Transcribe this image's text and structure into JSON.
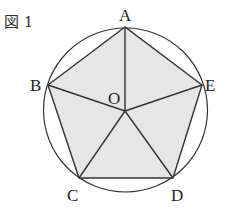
{
  "figure": {
    "caption": "図 1",
    "fill_color": "#e6e6e6",
    "stroke_color": "#333333",
    "circle": {
      "cx": 125.5,
      "cy": 110,
      "r": 82
    },
    "center": {
      "name": "O",
      "x": 125,
      "y": 111
    },
    "vertices": [
      {
        "name": "A",
        "x": 125,
        "y": 27
      },
      {
        "name": "B",
        "x": 48,
        "y": 85
      },
      {
        "name": "C",
        "x": 79,
        "y": 178
      },
      {
        "name": "D",
        "x": 173,
        "y": 178
      },
      {
        "name": "E",
        "x": 202,
        "y": 85
      }
    ],
    "labels": {
      "A": "A",
      "B": "B",
      "C": "C",
      "D": "D",
      "E": "E",
      "O": "O"
    }
  }
}
